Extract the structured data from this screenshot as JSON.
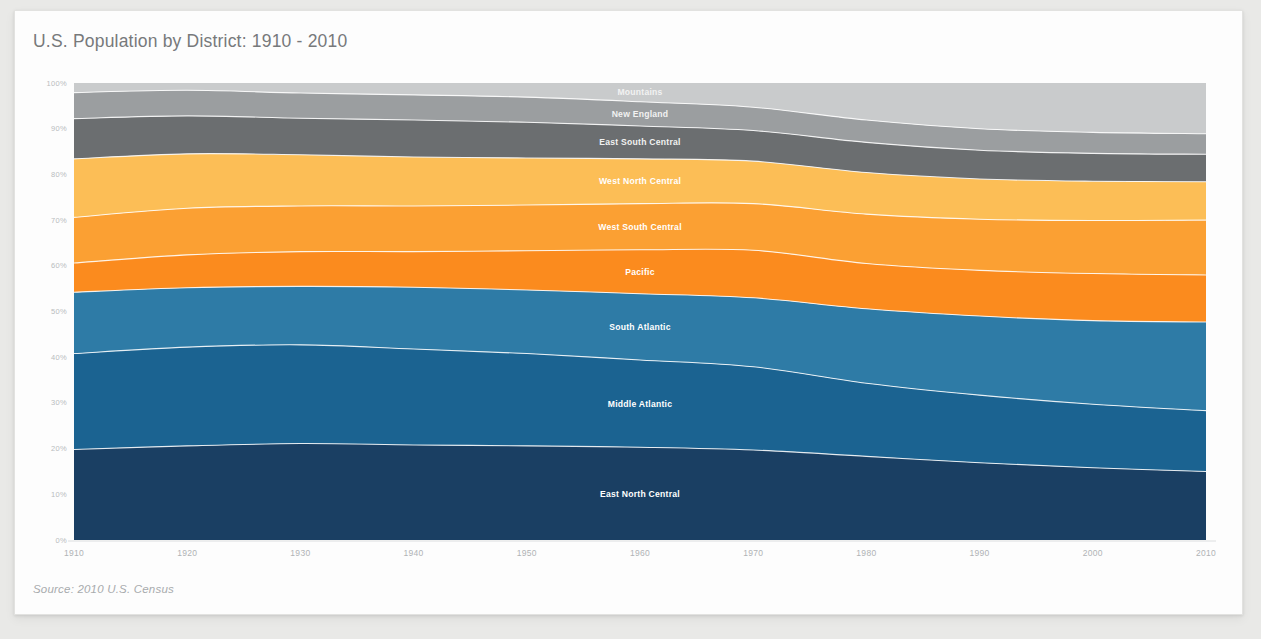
{
  "card": {
    "title": "U.S. Population by District: 1910 - 2010",
    "source": "Source: 2010 U.S. Census"
  },
  "chart_data": {
    "type": "area",
    "stacked": true,
    "normalized": true,
    "title": "U.S. Population by District: 1910 - 2010",
    "subtitle": "",
    "xlabel": "",
    "ylabel": "",
    "xlim": [
      1910,
      2010
    ],
    "ylim": [
      0,
      100
    ],
    "grid": false,
    "legend_position": "inline-labels",
    "x": [
      1910,
      1920,
      1930,
      1940,
      1950,
      1960,
      1970,
      1980,
      1990,
      2000,
      2010
    ],
    "xtick_labels": [
      "1910",
      "1920",
      "1930",
      "1940",
      "1950",
      "1960",
      "1970",
      "1980",
      "1990",
      "2000",
      "2010"
    ],
    "ytick_labels": [
      "0%",
      "10%",
      "20%",
      "30%",
      "40%",
      "50%",
      "60%",
      "70%",
      "80%",
      "90%",
      "100%"
    ],
    "ytick_values": [
      0,
      10,
      20,
      30,
      40,
      50,
      60,
      70,
      80,
      90,
      100
    ],
    "series": [
      {
        "name": "East North Central",
        "color": "#1a3f63",
        "values": [
          19.8,
          20.6,
          21.1,
          20.8,
          20.6,
          20.3,
          19.7,
          18.3,
          16.9,
          15.8,
          15.0
        ]
      },
      {
        "name": "Middle Atlantic",
        "color": "#1b6391",
        "values": [
          21.0,
          21.6,
          21.6,
          21.0,
          20.2,
          19.1,
          18.2,
          16.0,
          14.8,
          13.9,
          13.3
        ]
      },
      {
        "name": "South Atlantic",
        "color": "#2e7ba6",
        "values": [
          13.4,
          13.0,
          12.8,
          13.5,
          13.9,
          14.5,
          15.1,
          16.3,
          17.3,
          18.3,
          19.4
        ]
      },
      {
        "name": "Pacific",
        "color": "#fb8b1e",
        "values": [
          6.4,
          7.2,
          7.6,
          7.8,
          8.6,
          9.6,
          10.4,
          9.9,
          10.0,
          10.3,
          10.3
        ]
      },
      {
        "name": "West South Central",
        "color": "#fba033",
        "values": [
          10.0,
          10.2,
          10.0,
          10.0,
          10.0,
          10.1,
          10.2,
          10.8,
          11.2,
          11.6,
          12.0
        ]
      },
      {
        "name": "West North Central",
        "color": "#fcbe56",
        "values": [
          12.8,
          11.9,
          11.2,
          10.7,
          10.3,
          9.8,
          9.3,
          9.1,
          8.8,
          8.6,
          8.4
        ]
      },
      {
        "name": "East South Central",
        "color": "#6b6e70",
        "values": [
          8.8,
          8.3,
          8.0,
          8.1,
          7.8,
          7.2,
          6.7,
          6.6,
          6.3,
          6.1,
          6.0
        ]
      },
      {
        "name": "New England",
        "color": "#9b9ea0",
        "values": [
          5.7,
          5.6,
          5.5,
          5.5,
          5.5,
          5.3,
          5.1,
          4.9,
          4.7,
          4.6,
          4.5
        ]
      },
      {
        "name": "Mountains",
        "color": "#c9cbcc",
        "values": [
          2.1,
          1.6,
          2.2,
          2.6,
          3.1,
          4.1,
          5.3,
          8.1,
          10.0,
          10.8,
          11.1
        ]
      }
    ]
  }
}
